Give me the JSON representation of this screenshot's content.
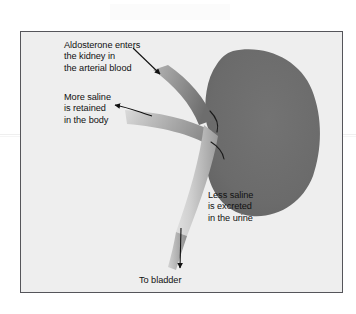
{
  "figure": {
    "background_color": "#eeeeee",
    "border_color": "#55555a",
    "page_color": "#ffffff"
  },
  "organ": {
    "name": "kidney",
    "fill_color": "#6b6b6b",
    "hilum_line_color": "#1a1a1a"
  },
  "vessels": [
    {
      "name": "renal-artery",
      "label": "arterial blood vessel",
      "color_light": "#a8a8a8",
      "color_dark": "#6f6f6f"
    },
    {
      "name": "renal-vein",
      "label": "venous blood vessel",
      "color_light": "#cfcfcf",
      "color_dark": "#8f8f8f"
    },
    {
      "name": "ureter",
      "label": "ureter to bladder",
      "color_light": "#d6d6d6",
      "color_dark": "#9a9a9a"
    }
  ],
  "captions": {
    "aldosterone": {
      "lines": [
        "Aldosterone enters",
        "the kidney in",
        "the arterial blood"
      ],
      "text": "Aldosterone enters\nthe kidney in\nthe arterial blood"
    },
    "retained": {
      "lines": [
        "More saline",
        "is retained",
        "in the body"
      ],
      "text": "More saline\nis retained\nin the body"
    },
    "excreted": {
      "lines": [
        "Less saline",
        "is excreted",
        "in the urine"
      ],
      "text": "Less saline\nis excreted\nin the urine"
    },
    "bladder": {
      "lines": [
        "To bladder"
      ],
      "text": "To bladder"
    }
  },
  "arrows": [
    {
      "name": "arrow-aldosterone",
      "direction": "down-right",
      "color": "#111111"
    },
    {
      "name": "arrow-retained",
      "direction": "left",
      "color": "#111111"
    },
    {
      "name": "arrow-bladder",
      "direction": "down",
      "color": "#111111"
    }
  ]
}
